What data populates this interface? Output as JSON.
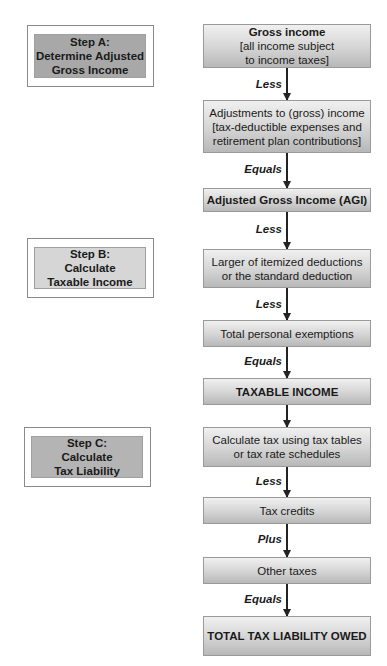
{
  "steps": [
    {
      "id": "A",
      "lines": [
        "Step A:",
        "Determine Adjusted",
        "Gross Income"
      ],
      "fill": "#a8a8a8"
    },
    {
      "id": "B",
      "lines": [
        "Step B:",
        "Calculate",
        "Taxable Income"
      ],
      "fill": "#d6d6d6"
    },
    {
      "id": "C",
      "lines": [
        "Step C:",
        "Calculate",
        "Tax Liability"
      ],
      "fill": "#b4b4b4"
    }
  ],
  "flow": [
    {
      "lines": [
        "Gross income",
        "[all income subject",
        "to income taxes]"
      ]
    },
    {
      "operator": "Less",
      "lines": [
        "Adjustments to (gross) income",
        "[tax-deductible expenses and",
        "retirement plan contributions]"
      ]
    },
    {
      "operator": "Equals",
      "lines": [
        "Adjusted Gross Income (AGI)"
      ]
    },
    {
      "operator": "Less",
      "lines": [
        "Larger of itemized deductions",
        "or the standard deduction"
      ]
    },
    {
      "operator": "Less",
      "lines": [
        "Total personal exemptions"
      ]
    },
    {
      "operator": "Equals",
      "lines": [
        "TAXABLE INCOME"
      ]
    },
    {
      "operator": "",
      "lines": [
        "Calculate tax using tax tables",
        "or tax rate schedules"
      ]
    },
    {
      "operator": "Less",
      "lines": [
        "Tax credits"
      ]
    },
    {
      "operator": "Plus",
      "lines": [
        "Other taxes"
      ]
    },
    {
      "operator": "Equals",
      "lines": [
        "TOTAL TAX LIABILITY OWED"
      ]
    }
  ]
}
